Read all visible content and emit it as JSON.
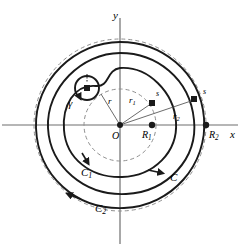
{
  "figure": {
    "type": "mathematical-diagram",
    "background_color": "#ffffff",
    "stroke_color": "#1a1a1a",
    "dashed_color": "#8a8a8a"
  },
  "axes": {
    "x_label": "x",
    "y_label": "y",
    "origin_label": "O",
    "origin": {
      "x": 120,
      "y": 125
    }
  },
  "points": [
    {
      "name": "origin",
      "label": "O",
      "marker": "dot",
      "x": 120,
      "y": 125,
      "label_x": 113,
      "label_y": 128
    },
    {
      "name": "R1",
      "label": "R",
      "sub": "1",
      "marker": "dot",
      "x": 152,
      "y": 125,
      "label_x": 143,
      "label_y": 128
    },
    {
      "name": "R2",
      "label": "R",
      "sub": "2",
      "marker": "dot",
      "x": 206,
      "y": 125,
      "label_x": 208,
      "label_y": 128
    },
    {
      "name": "s-inner",
      "label": "s",
      "marker": "square",
      "x": 152,
      "y": 103,
      "label_x": 155,
      "label_y": 91
    },
    {
      "name": "s-outer",
      "label": "s",
      "marker": "square",
      "x": 194,
      "y": 100,
      "label_x": 202,
      "label_y": 90
    },
    {
      "name": "gamma-center",
      "label": "",
      "marker": "square",
      "x": 87,
      "y": 88,
      "label_x": 0,
      "label_y": 0
    }
  ],
  "radii_labels": [
    {
      "name": "r",
      "label": "r",
      "sub": "",
      "x": 110,
      "y": 101
    },
    {
      "name": "r1",
      "label": "r",
      "sub": "1",
      "x": 131,
      "y": 101
    },
    {
      "name": "r2",
      "label": "r",
      "sub": "2",
      "x": 175,
      "y": 114
    }
  ],
  "curve_labels": [
    {
      "name": "C",
      "label": "C",
      "sub": "",
      "x": 172,
      "y": 176
    },
    {
      "name": "C1",
      "label": "C",
      "sub": "1",
      "x": 84,
      "y": 172
    },
    {
      "name": "C2",
      "label": "C",
      "sub": "2",
      "x": 98,
      "y": 208
    },
    {
      "name": "gamma",
      "label": "γ",
      "sub": "",
      "x": 71,
      "y": 100
    }
  ],
  "circles": {
    "inner_dashed_radius": 36,
    "outer_dashed_radius": 86,
    "gamma_radius": 12
  }
}
